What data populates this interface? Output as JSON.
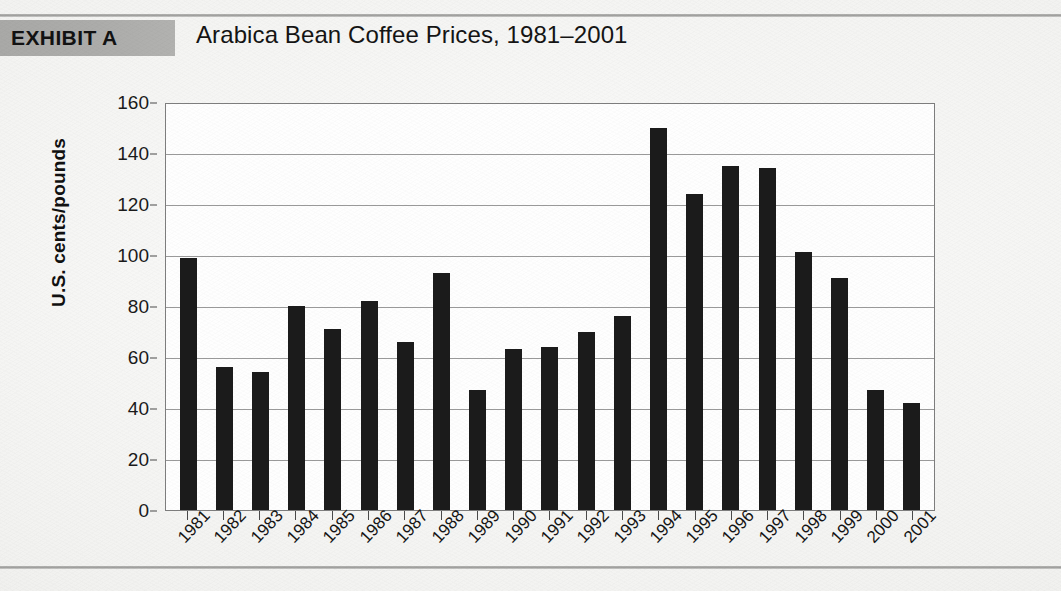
{
  "exhibit": {
    "badge": "EXHIBIT A",
    "title": "Arabica Bean Coffee Prices, 1981–2001"
  },
  "colors": {
    "bar": "#1b1b1b",
    "plot_background": "#fefefe",
    "gridline": "#9a9a9a",
    "band": "#acacaa",
    "page": "#f1f1ef"
  },
  "chart_data": {
    "type": "bar",
    "title": "Arabica Bean Coffee Prices, 1981–2001",
    "xlabel": "",
    "ylabel": "U.S. cents/pounds",
    "ylim": [
      0,
      160
    ],
    "ytick_step": 20,
    "yticks": [
      160,
      140,
      120,
      100,
      80,
      60,
      40,
      20,
      0
    ],
    "grid": true,
    "legend": null,
    "categories": [
      "1981",
      "1982",
      "1983",
      "1984",
      "1985",
      "1986",
      "1987",
      "1988",
      "1989",
      "1990",
      "1991",
      "1992",
      "1993",
      "1994",
      "1995",
      "1996",
      "1997",
      "1998",
      "1999",
      "2000",
      "2001"
    ],
    "values": [
      99,
      56,
      54,
      80,
      71,
      82,
      66,
      93,
      47,
      63,
      64,
      70,
      76,
      150,
      124,
      135,
      134,
      101,
      91,
      47,
      42
    ],
    "series": [
      {
        "name": "Arabica bean price",
        "units": "U.S. cents/pounds",
        "values": [
          99,
          56,
          54,
          80,
          71,
          82,
          66,
          93,
          47,
          63,
          64,
          70,
          76,
          150,
          124,
          135,
          134,
          101,
          91,
          47,
          42
        ]
      }
    ]
  }
}
